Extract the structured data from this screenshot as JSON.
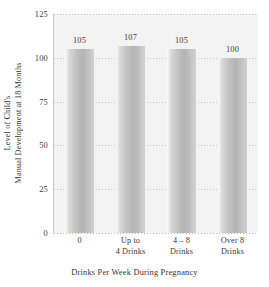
{
  "chart_data": {
    "type": "bar",
    "title": "",
    "categories": [
      "0",
      "Up to 4 Drinks",
      "4 – 8 Drinks",
      "Over 8 Drinks"
    ],
    "category_lines": [
      [
        "0"
      ],
      [
        "Up to",
        "4 Drinks"
      ],
      [
        "4 – 8",
        "Drinks"
      ],
      [
        "Over 8",
        "Drinks"
      ]
    ],
    "values": [
      105,
      107,
      105,
      100
    ],
    "value_labels": [
      "105",
      "107",
      "105",
      "100"
    ],
    "xlabel": "Drinks Per Week During Pregnancy",
    "ylabel_lines": [
      "Level of Child's",
      "Manual Development at 18 Months"
    ],
    "ylabel": "Level of Child's Manual Development at 18 Months",
    "yticks": [
      0,
      25,
      50,
      75,
      100,
      125
    ],
    "ytick_labels": [
      "0",
      "25",
      "50",
      "75",
      "100",
      "125"
    ],
    "ylim": [
      0,
      125
    ],
    "grid": true,
    "grid_style": "dotted",
    "legend": "none",
    "colors": {
      "plot_background": "#f3f3f3",
      "figure_background": "#ffffff",
      "bar_light": "#d8d8d8",
      "bar_dark": "#b4b4b4",
      "gridline": "#c4c4c4",
      "axis_line": "#c9c9c9",
      "text": "#3a3a3a"
    }
  }
}
